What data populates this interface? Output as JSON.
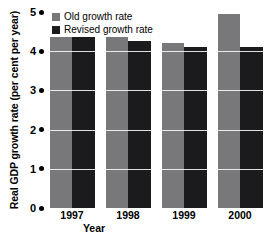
{
  "chart_data": {
    "type": "bar",
    "title": "",
    "xlabel": "Year",
    "ylabel": "Real GDP growth rate (per cent per year)",
    "categories": [
      "1997",
      "1998",
      "1999",
      "2000"
    ],
    "series": [
      {
        "name": "Old growth rate",
        "color": "#78787a",
        "values": [
          4.35,
          4.35,
          4.2,
          4.95
        ]
      },
      {
        "name": "Revised growth rate",
        "color": "#1b1b1d",
        "values": [
          4.35,
          4.25,
          4.1,
          4.1
        ]
      }
    ],
    "ylim": [
      0,
      5
    ],
    "yticks": [
      "0",
      "1",
      "2",
      "3",
      "4",
      "5"
    ],
    "grid": true,
    "legend_position": "top-left"
  },
  "axis": {
    "y_title": "Real GDP growth rate (per cent per year)",
    "x_title": "Year",
    "y_tick_labels": [
      "5",
      "4",
      "3",
      "2",
      "1",
      "0"
    ],
    "x_tick_labels": [
      "1997",
      "1998",
      "1999",
      "2000"
    ]
  },
  "legend": {
    "items": [
      {
        "label": "Old growth rate",
        "swatch": "gray-square-swatch"
      },
      {
        "label": "Revised growth rate",
        "swatch": "black-square-swatch"
      }
    ]
  }
}
